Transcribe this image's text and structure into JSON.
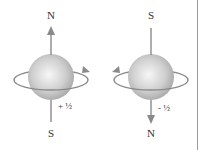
{
  "diagram": {
    "left": {
      "top_label": "N",
      "bottom_label": "S",
      "spin_label": "+ ½",
      "arrow_direction": "up",
      "rotation": "counterclockwise-front-right"
    },
    "right": {
      "top_label": "S",
      "bottom_label": "N",
      "spin_label": "- ½",
      "arrow_direction": "down",
      "rotation": "front-left"
    }
  },
  "colors": {
    "sphere_light": "#f2f2f2",
    "sphere_dark": "#a9a9a9",
    "line": "#8a8a8a",
    "text": "#333333",
    "divider": "#9a9a9a"
  }
}
